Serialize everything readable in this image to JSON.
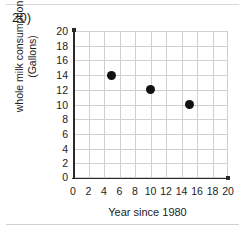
{
  "question": {
    "number_label": "20)"
  },
  "chart_data": {
    "type": "scatter",
    "title": "",
    "xlabel": "Year since 1980",
    "ylabel": "whole milk consumption (Gallons)",
    "ylabel_line1": "whole milk consumption",
    "ylabel_line2": "(Gallons)",
    "xlim": [
      0,
      20
    ],
    "ylim": [
      0,
      20
    ],
    "grid": true,
    "legend": "none",
    "marker_color": "#111111",
    "grid_color": "#cfcfcf",
    "axis_color": "#2a2a2a",
    "xticks": [
      0,
      2,
      4,
      6,
      8,
      10,
      12,
      14,
      16,
      18,
      20
    ],
    "yticks": [
      0,
      2,
      4,
      6,
      8,
      10,
      12,
      14,
      16,
      18,
      20
    ],
    "x": [
      5,
      10,
      15
    ],
    "y": [
      14,
      12,
      10
    ],
    "points": [
      {
        "x": 5,
        "y": 14
      },
      {
        "x": 10,
        "y": 12
      },
      {
        "x": 15,
        "y": 10
      }
    ]
  }
}
